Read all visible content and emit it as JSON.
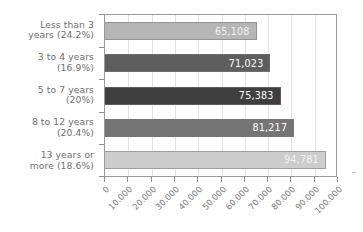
{
  "chart_data": {
    "type": "bar",
    "orientation": "horizontal",
    "title": "",
    "subtitle": "",
    "xlabel": "",
    "ylabel": "",
    "xlim": [
      0,
      100000
    ],
    "grid": true,
    "legend": "none",
    "categories": [
      "Less than 3\nyears (24.2%)",
      "3 to 4 years\n(16.9%)",
      "5 to 7 years\n(20%)",
      "8 to 12 years\n(20.4%)",
      "13 years or\nmore (18.6%)"
    ],
    "values": [
      65108,
      71023,
      75383,
      81217,
      94781
    ],
    "value_labels": [
      "65,108",
      "71,023",
      "75,383",
      "81,217",
      "94,781"
    ],
    "percent_labels": [
      "24.2%",
      "16.9%",
      "20%",
      "20.4%",
      "18.6%"
    ],
    "bar_colors": [
      "#b6b6b6",
      "#5e5e5e",
      "#3f3f3f",
      "#757575",
      "#cdcdcd"
    ],
    "xticks": [
      0,
      10000,
      20000,
      30000,
      40000,
      50000,
      60000,
      70000,
      80000,
      90000,
      100000
    ],
    "xtick_labels": [
      "0",
      "10.000",
      "20.000",
      "30.000",
      "40.000",
      "50.000",
      "60.000",
      "70.000",
      "80.000",
      "90.000",
      "100.000"
    ]
  },
  "colors": {
    "background": "#ffffff",
    "axis": "#9a9a9a",
    "grid": "#e2e2e2",
    "label_text": "#6e6e6e",
    "value_text": "#ffffff"
  }
}
